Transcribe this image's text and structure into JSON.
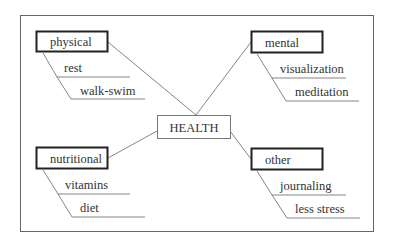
{
  "diagram": {
    "center": {
      "label": "HEALTH"
    },
    "branches": [
      {
        "label": "physical",
        "items": [
          "rest",
          "walk-swim"
        ]
      },
      {
        "label": "mental",
        "items": [
          "visualization",
          "meditation"
        ]
      },
      {
        "label": "nutritional",
        "items": [
          "vitamins",
          "diet"
        ]
      },
      {
        "label": "other",
        "items": [
          "journaling",
          "less stress"
        ]
      }
    ]
  },
  "colors": {
    "line": "#555555",
    "text": "#333333",
    "background": "#ffffff"
  }
}
